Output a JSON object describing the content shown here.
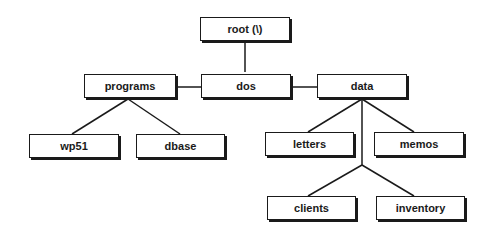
{
  "diagram": {
    "type": "directory-tree",
    "nodes": [
      {
        "id": "root",
        "label": "root (\\)",
        "x": 200,
        "y": 17,
        "w": 90,
        "h": 24
      },
      {
        "id": "dos",
        "label": "dos",
        "x": 201,
        "y": 72,
        "w": 88,
        "h": 24
      },
      {
        "id": "programs",
        "label": "programs",
        "x": 84,
        "y": 74,
        "w": 90,
        "h": 24
      },
      {
        "id": "data",
        "label": "data",
        "x": 317,
        "y": 74,
        "w": 90,
        "h": 24
      },
      {
        "id": "wp51",
        "label": "wp51",
        "x": 29,
        "y": 134,
        "w": 90,
        "h": 24
      },
      {
        "id": "dbase",
        "label": "dbase",
        "x": 136,
        "y": 134,
        "w": 89,
        "h": 24
      },
      {
        "id": "letters",
        "label": "letters",
        "x": 265,
        "y": 132,
        "w": 89,
        "h": 24
      },
      {
        "id": "memos",
        "label": "memos",
        "x": 374,
        "y": 132,
        "w": 90,
        "h": 24
      },
      {
        "id": "clients",
        "label": "clients",
        "x": 267,
        "y": 196,
        "w": 89,
        "h": 24
      },
      {
        "id": "inventory",
        "label": "inventory",
        "x": 376,
        "y": 196,
        "w": 89,
        "h": 24
      }
    ],
    "edges": [
      {
        "from": "root",
        "to": "dos"
      },
      {
        "from": "dos",
        "to": "programs"
      },
      {
        "from": "dos",
        "to": "data"
      },
      {
        "from": "programs",
        "to": "wp51"
      },
      {
        "from": "programs",
        "to": "dbase"
      },
      {
        "from": "data",
        "to": "letters"
      },
      {
        "from": "data",
        "to": "memos"
      },
      {
        "from": "data",
        "to": "clients"
      },
      {
        "from": "data",
        "to": "inventory"
      }
    ]
  }
}
